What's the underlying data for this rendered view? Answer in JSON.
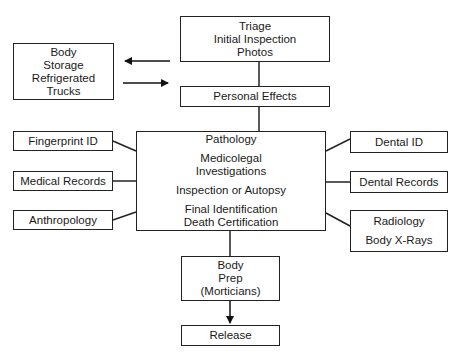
{
  "diagram": {
    "nodes": {
      "triage": [
        "Triage",
        "Initial Inspection",
        "Photos"
      ],
      "body_storage": [
        "Body",
        "Storage",
        "Refrigerated",
        "Trucks"
      ],
      "personal_effects": [
        "Personal Effects"
      ],
      "center": {
        "pathology": "Pathology",
        "medicolegal": [
          "Medicolegal",
          "Investigations"
        ],
        "inspection": "Inspection or Autopsy",
        "final": [
          "Final Identification",
          "Death Certification"
        ]
      },
      "fingerprint": "Fingerprint ID",
      "medical_records": "Medical Records",
      "anthropology": "Anthropology",
      "dental_id": "Dental ID",
      "dental_records": "Dental Records",
      "radiology": [
        "Radiology",
        "Body X-Rays"
      ],
      "body_prep": [
        "Body",
        "Prep",
        "(Morticians)"
      ],
      "release": "Release"
    },
    "edges": [
      {
        "from": "triage",
        "to": "body_storage",
        "arrow": true
      },
      {
        "from": "body_storage",
        "to": "personal_effects",
        "arrow": true
      },
      {
        "from": "triage",
        "to": "personal_effects",
        "arrow": false
      },
      {
        "from": "personal_effects",
        "to": "center",
        "arrow": false
      },
      {
        "from": "fingerprint",
        "to": "center",
        "arrow": false
      },
      {
        "from": "medical_records",
        "to": "center",
        "arrow": false
      },
      {
        "from": "anthropology",
        "to": "center",
        "arrow": false
      },
      {
        "from": "dental_id",
        "to": "center",
        "arrow": false
      },
      {
        "from": "dental_records",
        "to": "center",
        "arrow": false
      },
      {
        "from": "radiology",
        "to": "center",
        "arrow": false
      },
      {
        "from": "center",
        "to": "body_prep",
        "arrow": false
      },
      {
        "from": "body_prep",
        "to": "release",
        "arrow": true
      }
    ]
  }
}
